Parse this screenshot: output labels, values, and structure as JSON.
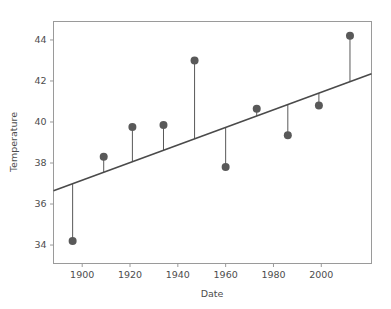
{
  "chart_data": {
    "type": "scatter",
    "title": "",
    "xlabel": "Date",
    "ylabel": "Temperature",
    "xlim": [
      1888,
      2021
    ],
    "ylim": [
      33.1,
      44.9
    ],
    "xticks": [
      1900,
      1920,
      1940,
      1960,
      1980,
      2000
    ],
    "xtick_labels": [
      "1900",
      "1920",
      "1940",
      "1960",
      "1980",
      "2000"
    ],
    "yticks": [
      34,
      36,
      38,
      40,
      42,
      44
    ],
    "ytick_labels": [
      "34",
      "36",
      "38",
      "40",
      "42",
      "44"
    ],
    "grid": false,
    "legend": false,
    "x": [
      1896,
      1909,
      1921,
      1934,
      1947,
      1960,
      1973,
      1986,
      1999,
      2012
    ],
    "y": [
      34.2,
      38.3,
      39.75,
      39.85,
      43.0,
      37.8,
      40.65,
      39.35,
      40.8,
      44.2
    ],
    "series": [
      {
        "name": "observations",
        "x": [
          1896,
          1909,
          1921,
          1934,
          1947,
          1960,
          1973,
          1986,
          1999,
          2012
        ],
        "values": [
          34.2,
          38.3,
          39.75,
          39.85,
          43.0,
          37.8,
          40.65,
          39.35,
          40.8,
          44.2
        ]
      },
      {
        "name": "fit-line",
        "x": [
          1888,
          2021
        ],
        "values": [
          36.65,
          42.35
        ]
      }
    ],
    "residual_stems": true,
    "marker_color": "#595959",
    "line_color": "#4a4a4a",
    "axis_color": "#9a9a9a",
    "text_color": "#4d4d4d",
    "background_color": "#ffffff",
    "marker_size": 5.2,
    "line_width": 1.6,
    "stem_width": 1.0
  }
}
